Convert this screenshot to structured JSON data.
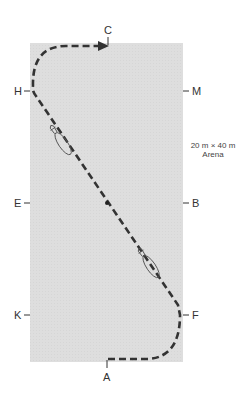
{
  "arena": {
    "size_label": "20 m × 40 m",
    "name_label": "Arena",
    "fill_color": "#dedede",
    "path_color": "#333333"
  },
  "markers": {
    "top": "C",
    "bottom": "A",
    "left_top": "H",
    "left_mid": "E",
    "left_bottom": "K",
    "right_top": "M",
    "right_mid": "B",
    "right_bottom": "F"
  },
  "icons": {
    "horse_1": "horse-icon",
    "horse_2": "horse-icon",
    "arrow": "arrowhead-icon",
    "midpoint": "center-dot-icon"
  }
}
